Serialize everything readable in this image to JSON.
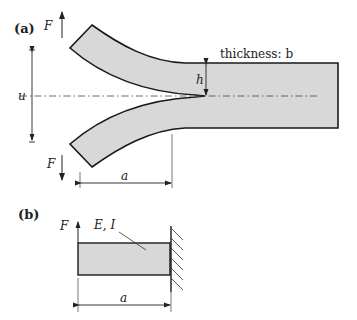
{
  "panel_a": {
    "label": "(a)",
    "force_top": "F",
    "force_bottom": "F",
    "opening": "u",
    "half_height": "h",
    "thickness_label": "thickness: b",
    "crack_length": "a"
  },
  "panel_b": {
    "label": "(b)",
    "force": "F",
    "properties": "E, I",
    "length": "a"
  },
  "colors": {
    "fill": "#d8d8d8",
    "stroke": "#1a1a1a",
    "dim_line": "#333333"
  }
}
